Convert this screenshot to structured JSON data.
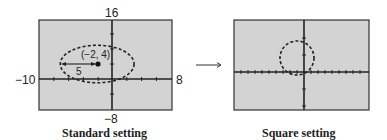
{
  "standard_plot": {
    "caption": "Standard setting",
    "ymax_label": "16",
    "ymin_label": "−8",
    "xmin_label": "−10",
    "xmax_label": "8",
    "window": {
      "xmin": -10,
      "xmax": 8,
      "ymin": -8,
      "ymax": 16
    },
    "center_label": "(−2, 4)",
    "radius_label": "5"
  },
  "transition_arrow": "→",
  "square_plot": {
    "caption": "Square setting"
  },
  "graph": {
    "shape": "circle",
    "center": [
      -2,
      4
    ],
    "radius": 5,
    "screen_bg": "#d3d3d3",
    "curve_color": "#222222"
  }
}
